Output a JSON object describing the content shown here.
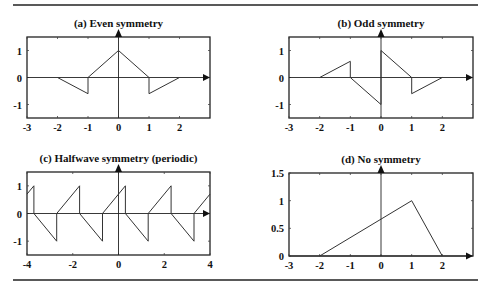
{
  "figure": {
    "rule_color": "#222222",
    "line_color": "#333333"
  },
  "chart_data": [
    {
      "id": "a",
      "type": "line",
      "title": "(a)  Even symmetry",
      "xlabel": "",
      "ylabel": "",
      "xlim": [
        -3,
        3
      ],
      "ylim": [
        -1.5,
        1.5
      ],
      "xticks": [
        -3,
        -2,
        -1,
        0,
        1,
        2
      ],
      "xtick_labels": [
        "-3",
        "-2",
        "-1",
        "0",
        "1",
        "2"
      ],
      "yticks": [
        -1,
        0,
        1
      ],
      "ytick_labels": [
        "-1",
        "0",
        "1"
      ],
      "grid": false,
      "frame": {
        "left": 27,
        "top": 37,
        "right": 210,
        "bottom": 118
      },
      "series": [
        {
          "name": "f(t)",
          "x": [
            -2,
            -1,
            -1,
            0,
            1,
            1,
            2
          ],
          "y": [
            0,
            -0.6,
            0,
            1,
            0,
            -0.6,
            0
          ]
        }
      ]
    },
    {
      "id": "b",
      "type": "line",
      "title": "(b)  Odd symmetry",
      "xlabel": "",
      "ylabel": "",
      "xlim": [
        -3,
        3
      ],
      "ylim": [
        -1.5,
        1.5
      ],
      "xticks": [
        -3,
        -2,
        -1,
        0,
        1,
        2
      ],
      "xtick_labels": [
        "-3",
        "-2",
        "-1",
        "0",
        "1",
        "2"
      ],
      "yticks": [
        -1,
        0,
        1
      ],
      "ytick_labels": [
        "-1",
        "0",
        "1"
      ],
      "grid": false,
      "frame": {
        "left": 289,
        "top": 37,
        "right": 473,
        "bottom": 118
      },
      "series": [
        {
          "name": "f(t)",
          "x": [
            -2,
            -1,
            -1,
            0,
            0,
            1,
            1,
            2
          ],
          "y": [
            0,
            0.6,
            0,
            -1,
            1,
            0,
            -0.6,
            0
          ]
        }
      ]
    },
    {
      "id": "c",
      "type": "line",
      "title": "(c)  Halfwave symmetry (periodic)",
      "xlabel": "",
      "ylabel": "",
      "xlim": [
        -4,
        4
      ],
      "ylim": [
        -1.5,
        1.5
      ],
      "xticks": [
        -4,
        -2,
        0,
        2,
        4
      ],
      "xtick_labels": [
        "-4",
        "-2",
        "0",
        "2",
        "4"
      ],
      "yticks": [
        -1,
        0,
        1
      ],
      "ytick_labels": [
        "-1",
        "0",
        "1"
      ],
      "grid": false,
      "frame": {
        "left": 27,
        "top": 172,
        "right": 210,
        "bottom": 255
      },
      "series": [
        {
          "name": "f(t)",
          "x": [
            -4,
            -3.7,
            -3.7,
            -2.7,
            -2.7,
            -1.7,
            -1.7,
            -0.7,
            -0.7,
            0.3,
            0.3,
            1.3,
            1.3,
            2.3,
            2.3,
            3.3,
            3.3,
            4
          ],
          "y": [
            0.7,
            1,
            0,
            -1,
            0,
            1,
            0,
            -1,
            0,
            1,
            0,
            -1,
            0,
            1,
            0,
            -1,
            0,
            0.7
          ]
        }
      ]
    },
    {
      "id": "d",
      "type": "line",
      "title": "(d)  No symmetry",
      "xlabel": "",
      "ylabel": "",
      "xlim": [
        -3,
        3
      ],
      "ylim": [
        0,
        1.5
      ],
      "xticks": [
        -3,
        -2,
        -1,
        0,
        1,
        2
      ],
      "xtick_labels": [
        "-3",
        "-2",
        "-1",
        "0",
        "1",
        "2"
      ],
      "yticks": [
        0,
        0.5,
        1,
        1.5
      ],
      "ytick_labels": [
        "0",
        "0.5",
        "1",
        "1.5"
      ],
      "grid": false,
      "frame": {
        "left": 289,
        "top": 173,
        "right": 473,
        "bottom": 256
      },
      "series": [
        {
          "name": "f(t)",
          "x": [
            -2,
            1,
            2
          ],
          "y": [
            0,
            1,
            0
          ]
        }
      ]
    }
  ]
}
